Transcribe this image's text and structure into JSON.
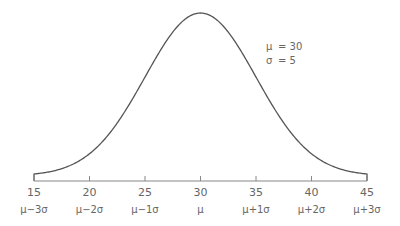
{
  "chart_data": {
    "type": "line",
    "title": "",
    "xlabel": "",
    "ylabel": "",
    "mean": 30,
    "sd": 5,
    "x_ticks": [
      15,
      20,
      25,
      30,
      35,
      40,
      45
    ],
    "x_tick_labels": [
      "15",
      "20",
      "25",
      "30",
      "35",
      "40",
      "45"
    ],
    "sigma_labels": [
      "μ−3σ",
      "μ−2σ",
      "μ−1σ",
      "μ",
      "μ+1σ",
      "μ+2σ",
      "μ+3σ"
    ],
    "xlim": [
      15,
      45
    ],
    "grid": false,
    "annotations": [
      {
        "symbol": "μ",
        "text": "= 30"
      },
      {
        "symbol": "σ",
        "text": "= 5"
      }
    ],
    "colors": {
      "curve": "#555555",
      "axis": "#888888"
    }
  }
}
